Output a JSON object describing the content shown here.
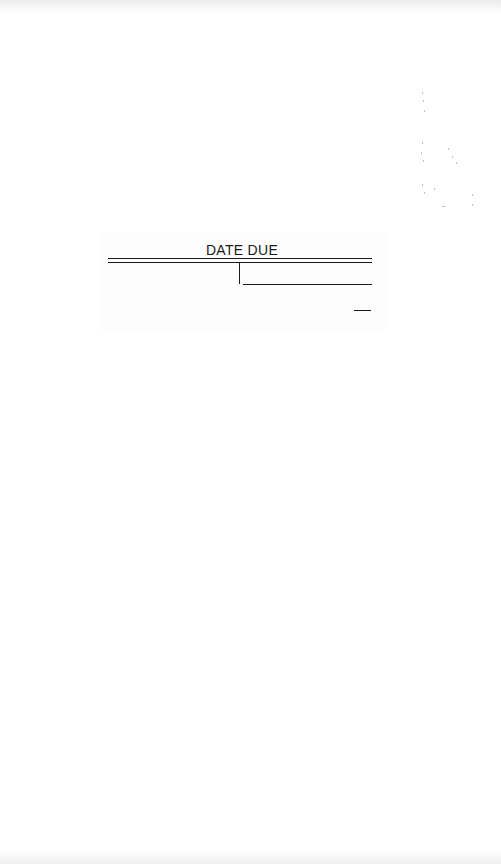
{
  "slip": {
    "title": "DATE DUE",
    "columns": 2,
    "entries": []
  },
  "colors": {
    "ink": "#1a1a1a",
    "paper": "#ffffff"
  }
}
